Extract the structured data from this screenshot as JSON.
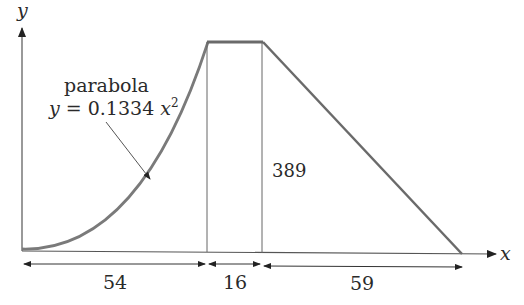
{
  "diagram": {
    "axes": {
      "x_label": "x",
      "y_label": "y"
    },
    "curve_label": {
      "name": "parabola",
      "equation_prefix": "y = 0.1334",
      "equation_var": "x",
      "equation_exp": "2"
    },
    "height_label": "389",
    "dimensions": [
      {
        "label": "54"
      },
      {
        "label": "16"
      },
      {
        "label": "59"
      }
    ],
    "colors": {
      "curve": "#777777",
      "lines": "#555555",
      "text": "#2a2a2a"
    }
  }
}
